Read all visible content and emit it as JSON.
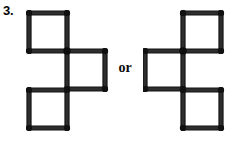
{
  "page": {
    "width": 237,
    "height": 145,
    "background_color": "#ffffff",
    "kind": "matchstick-puzzle-answer-figure"
  },
  "problem": {
    "number_label": "3.",
    "connector_label": "or",
    "description": "Two alternative matchstick arrangements, each forming three squares in a diagonal staircase, shown as mirror images separated by the word or."
  },
  "colors": {
    "ink": "#111111",
    "match_body": "#2e2e2e",
    "match_outline": "#151515",
    "match_head": "#111111",
    "paper": "#ffffff"
  },
  "geometry": {
    "cell_size": 38,
    "match_thickness": 4,
    "head_radius": 3.1
  },
  "figures": [
    {
      "id": "figure-left",
      "name": "left-arrangement",
      "origin": {
        "x": 26,
        "y": 9
      },
      "squares": [
        {
          "id": "left-square-top",
          "position": "top-left",
          "x": 3,
          "y": 4,
          "size": 38
        },
        {
          "id": "left-square-middle",
          "position": "middle-right",
          "x": 41,
          "y": 42,
          "size": 38
        },
        {
          "id": "left-square-bottom",
          "position": "bottom-left",
          "x": 3,
          "y": 81,
          "size": 38
        }
      ],
      "match_count": 12,
      "square_count": 3
    },
    {
      "id": "figure-right",
      "name": "right-arrangement",
      "origin": {
        "x": 143,
        "y": 9
      },
      "squares": [
        {
          "id": "right-square-top",
          "position": "top-right",
          "x": 40,
          "y": 4,
          "size": 38
        },
        {
          "id": "right-square-middle",
          "position": "middle-left",
          "x": 2,
          "y": 42,
          "size": 38
        },
        {
          "id": "right-square-bottom",
          "position": "bottom-right",
          "x": 40,
          "y": 81,
          "size": 38
        }
      ],
      "match_count": 12,
      "square_count": 3
    }
  ]
}
